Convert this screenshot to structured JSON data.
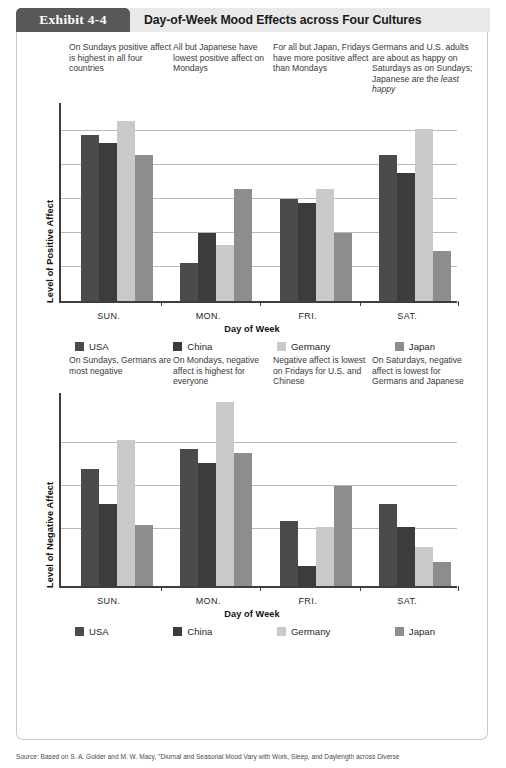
{
  "exhibit": {
    "tab_label": "Exhibit 4-4",
    "title": "Day-of-Week Mood Effects across Four Cultures"
  },
  "colors": {
    "usa": "#4b4b4d",
    "china": "#3c3c3e",
    "germany": "#c9c9c9",
    "japan": "#8d8d8f",
    "axis": "#3d3d3d",
    "grid": "#b9b9b9",
    "tab_bg": "#58585a",
    "titlebar_bg": "#e9e9e9"
  },
  "legend": {
    "items": [
      {
        "label": "USA",
        "color": "#4b4b4d"
      },
      {
        "label": "China",
        "color": "#3c3c3e"
      },
      {
        "label": "Germany",
        "color": "#c9c9c9"
      },
      {
        "label": "Japan",
        "color": "#8d8d8f"
      }
    ]
  },
  "notes_top": [
    "On Sundays positive affect is highest in all four countries",
    "All but Japanese have lowest positive affect on Mondays",
    "For all but Japan, Fridays have more positive affect than Mondays",
    "Germans and U.S. adults are about as happy on Saturdays as on Sundays; Japanese are the least happy"
  ],
  "notes_mid": [
    "On Sundays, Germans are most negative",
    "On Mondays, negative affect is highest for everyone",
    "Negative affect is lowest on Fridays for U.S. and Chinese",
    "On Saturdays, negative affect is lowest for Germans and Japanese"
  ],
  "source": "Source: Based on S. A. Golder and M. W. Macy, \"Diurnal and Seasonal Mood Vary with Work, Sleep, and Daylength across Diverse",
  "chart_data": [
    {
      "type": "bar",
      "title": "",
      "xlabel": "Day of Week",
      "ylabel": "Level of Positive Affect",
      "categories": [
        "SUN.",
        "MON.",
        "FRI.",
        "SAT."
      ],
      "ylim": [
        0,
        100
      ],
      "grid": true,
      "gridlines": [
        17,
        34,
        51,
        68,
        85
      ],
      "legend_position": "bottom",
      "series": [
        {
          "name": "USA",
          "color": "#4b4b4d",
          "values": [
            83,
            19,
            51,
            73
          ]
        },
        {
          "name": "China",
          "color": "#3c3c3e",
          "values": [
            79,
            34,
            49,
            64
          ]
        },
        {
          "name": "Germany",
          "color": "#c9c9c9",
          "values": [
            90,
            28,
            56,
            86
          ]
        },
        {
          "name": "Japan",
          "color": "#8d8d8f",
          "values": [
            73,
            56,
            34,
            25
          ]
        }
      ]
    },
    {
      "type": "bar",
      "title": "",
      "xlabel": "Day of Week",
      "ylabel": "Level of Negative Affect",
      "categories": [
        "SUN.",
        "MON.",
        "FRI.",
        "SAT."
      ],
      "ylim": [
        0,
        100
      ],
      "grid": true,
      "gridlines": [
        29,
        51,
        73
      ],
      "legend_position": "bottom",
      "series": [
        {
          "name": "USA",
          "color": "#4b4b4d",
          "values": [
            60,
            70,
            33,
            42
          ]
        },
        {
          "name": "China",
          "color": "#3c3c3e",
          "values": [
            42,
            63,
            10,
            30
          ]
        },
        {
          "name": "Germany",
          "color": "#c9c9c9",
          "values": [
            75,
            94,
            30,
            20
          ]
        },
        {
          "name": "Japan",
          "color": "#8d8d8f",
          "values": [
            31,
            68,
            51,
            12
          ]
        }
      ]
    }
  ]
}
